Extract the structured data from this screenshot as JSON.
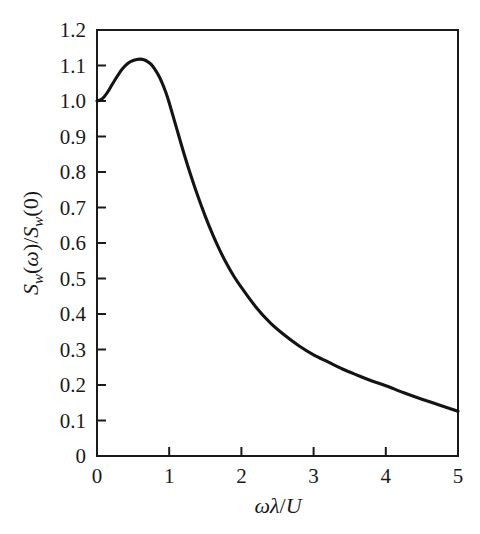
{
  "figure": {
    "background_color": "#ffffff",
    "curve_color": "#141414",
    "axis_color": "#1a1a1a"
  },
  "chart_data": {
    "type": "line",
    "title": "",
    "subtitle": "",
    "xlabel": "ωλ/U",
    "ylabel": "S_w(ω)/S_w(0)",
    "ylabel_parts": {
      "s1": "S",
      "sub1": "w",
      "open1": "(",
      "omega": "ω",
      "close1": ")",
      "slash": "/",
      "s2": "S",
      "sub2": "w",
      "open2": "(",
      "zero": "0",
      "close2": ")"
    },
    "xlabel_parts": {
      "omega": "ω",
      "lambda": "λ",
      "slash": "/",
      "u": "U"
    },
    "xlim": [
      0,
      5
    ],
    "ylim": [
      0,
      1.2
    ],
    "xticks": [
      0,
      1,
      2,
      3,
      4,
      5
    ],
    "xtick_labels": [
      "0",
      "1",
      "2",
      "3",
      "4",
      "5"
    ],
    "yticks": [
      0,
      0.1,
      0.2,
      0.3,
      0.4,
      0.5,
      0.6,
      0.7,
      0.8,
      0.9,
      1.0,
      1.1,
      1.2
    ],
    "ytick_labels": [
      "0",
      "0.1",
      "0.2",
      "0.3",
      "0.4",
      "0.5",
      "0.6",
      "0.7",
      "0.8",
      "0.9",
      "1.0",
      "1.1",
      "1.2"
    ],
    "grid": false,
    "legend": false,
    "legend_position": "none",
    "annotations": [],
    "series": [
      {
        "name": "normalized vertical velocity spectrum",
        "x": [
          0.0,
          0.05,
          0.1,
          0.15,
          0.2,
          0.25,
          0.3,
          0.35,
          0.4,
          0.45,
          0.5,
          0.55,
          0.6,
          0.65,
          0.7,
          0.75,
          0.8,
          0.85,
          0.9,
          0.95,
          1.0,
          1.1,
          1.2,
          1.3,
          1.4,
          1.5,
          1.6,
          1.7,
          1.8,
          1.9,
          2.0,
          2.2,
          2.4,
          2.6,
          2.8,
          3.0,
          3.2,
          3.4,
          3.6,
          3.8,
          4.0,
          4.25,
          4.5,
          4.75,
          5.0
        ],
        "y": [
          1.0,
          1.003,
          1.012,
          1.026,
          1.043,
          1.06,
          1.076,
          1.09,
          1.101,
          1.109,
          1.114,
          1.117,
          1.118,
          1.116,
          1.111,
          1.103,
          1.09,
          1.073,
          1.052,
          1.026,
          0.995,
          0.925,
          0.855,
          0.79,
          0.73,
          0.675,
          0.625,
          0.58,
          0.54,
          0.505,
          0.475,
          0.42,
          0.375,
          0.34,
          0.31,
          0.285,
          0.265,
          0.245,
          0.228,
          0.212,
          0.198,
          0.178,
          0.16,
          0.143,
          0.126
        ]
      }
    ],
    "peak": {
      "x": 0.6,
      "y": 1.118
    },
    "start_point": {
      "x": 0,
      "y": 1.0
    },
    "end_point": {
      "x": 5,
      "y": 0.126
    }
  }
}
